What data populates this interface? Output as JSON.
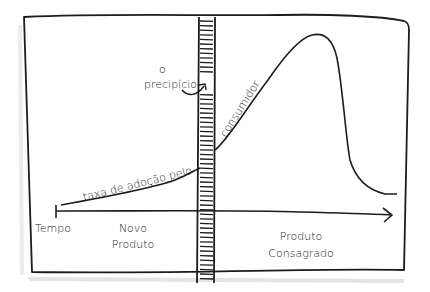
{
  "diagram": {
    "type": "hand-drawn technology adoption curve with chasm",
    "colors": {
      "ink": "#1c1c1c",
      "background": "#ffffff",
      "shadow": "#d9d9d9"
    },
    "labels": {
      "chasm_line1": "o",
      "chasm_line2": "precipício",
      "curve_left": "taxa de adoção pelo",
      "curve_right": "consumidor",
      "axis": "Tempo",
      "phase_left_line1": "Novo",
      "phase_left_line2": "Produto",
      "phase_right_line1": "Produto",
      "phase_right_line2": "Consagrado"
    }
  }
}
